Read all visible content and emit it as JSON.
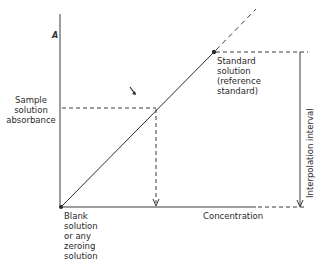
{
  "diagram": {
    "type": "calibration-curve",
    "y_axis_label": "A",
    "x_axis_label": "Concentration",
    "sample_label": [
      "Sample",
      "solution",
      "absorbance"
    ],
    "blank_label": [
      "Blank",
      "solution",
      "or any",
      "zeroing",
      "solution"
    ],
    "standard_label": [
      "Standard",
      "solution",
      "(reference",
      "standard)"
    ],
    "interval_label": "Interpolation interval",
    "colors": {
      "line": "#2b2b2b",
      "background": "#ffffff"
    }
  }
}
